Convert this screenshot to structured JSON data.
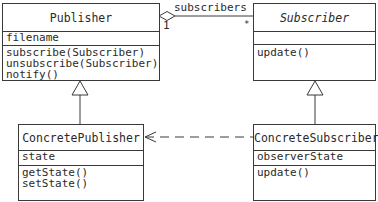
{
  "diagram": {
    "type": "uml-class-diagram",
    "classes": [
      {
        "id": "publisher",
        "name": "Publisher",
        "abstract": false,
        "attributes": [
          "filename"
        ],
        "operations": [
          "subscribe(Subscriber)",
          "unsubscribe(Subscriber)",
          "notify()"
        ]
      },
      {
        "id": "subscriber",
        "name": "Subscriber",
        "abstract": true,
        "attributes": [],
        "operations": [
          "update()"
        ]
      },
      {
        "id": "concrete-publisher",
        "name": "ConcretePublisher",
        "abstract": false,
        "attributes": [
          "state"
        ],
        "operations": [
          "getState()",
          "setState()"
        ]
      },
      {
        "id": "concrete-subscriber",
        "name": "ConcreteSubscriber",
        "abstract": false,
        "attributes": [
          "observerState"
        ],
        "operations": [
          "update()"
        ]
      }
    ],
    "relationships": [
      {
        "type": "aggregation",
        "from": "Publisher",
        "to": "Subscriber",
        "role": "subscribers",
        "source_multiplicity": "1",
        "target_multiplicity": "*"
      },
      {
        "type": "generalization",
        "from": "ConcretePublisher",
        "to": "Publisher"
      },
      {
        "type": "generalization",
        "from": "ConcreteSubscriber",
        "to": "Subscriber"
      },
      {
        "type": "dependency",
        "from": "ConcreteSubscriber",
        "to": "ConcretePublisher"
      }
    ],
    "colors": {
      "line": "#3a3a3a",
      "background": "#ffffff",
      "text": "#2a2a2a"
    }
  }
}
